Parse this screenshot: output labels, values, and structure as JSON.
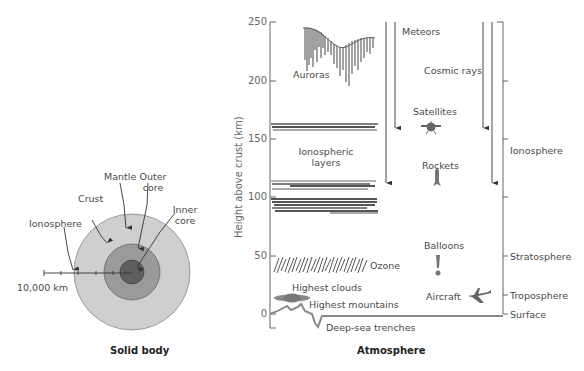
{
  "solid_body": {
    "caption": "Solid body",
    "labels": {
      "mantle": "Mantle",
      "outer_core": [
        "Outer",
        "core"
      ],
      "crust": "Crust",
      "inner_core": [
        "Inner",
        "core"
      ],
      "ionosphere": "Ionosphere",
      "scale": "10,000 km"
    },
    "colors": {
      "crust_mantle": "#c8c8c8",
      "outer_core": "#8e8e8e",
      "inner_core": "#5a5a5a"
    }
  },
  "atmosphere": {
    "caption": "Atmosphere",
    "y_axis": {
      "label": "Height above crust (km)",
      "ticks": [
        "250",
        "200",
        "150",
        "100",
        "50",
        "0"
      ]
    },
    "phenomena": {
      "auroras": "Auroras",
      "meteors": "Meteors",
      "cosmic_rays": "Cosmic rays",
      "satellites": "Satellites",
      "ionospheric_layers": [
        "Ionospheric",
        "layers"
      ],
      "rockets": "Rockets",
      "balloons": "Balloons",
      "ozone": "Ozone",
      "highest_clouds": "Highest clouds",
      "highest_mountains": "Highest mountains",
      "aircraft": "Aircraft",
      "deep_sea_trenches": "Deep-sea trenches"
    },
    "layers": {
      "ionosphere": "Ionosphere",
      "stratosphere": "Stratosphere",
      "troposphere": "Troposphere",
      "surface": "Surface"
    }
  }
}
